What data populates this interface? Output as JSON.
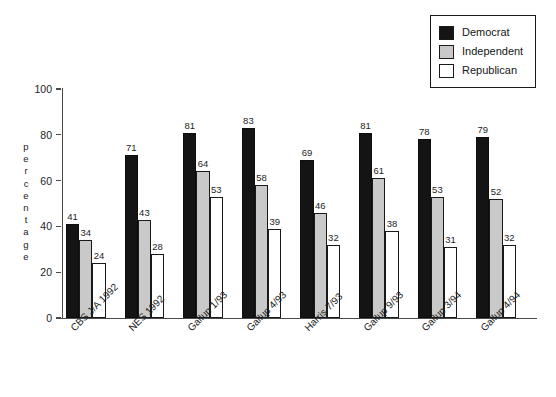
{
  "chart_data": {
    "type": "bar",
    "title": "",
    "subtitle": "",
    "xlabel": "",
    "ylabel": "percentage",
    "ylim": [
      0,
      100
    ],
    "yticks": [
      0,
      20,
      40,
      60,
      80,
      100
    ],
    "grid": false,
    "legend_position": "top-right",
    "categories": [
      "CBS J/A 1992",
      "NES 1992",
      "Gallup 1/93",
      "Gallup 4/93",
      "Harris 7/93",
      "Gallup 9/93",
      "Gallup 3/94",
      "Gallup 4/94"
    ],
    "series": [
      {
        "name": "Democrat",
        "color": "#141414",
        "values": [
          41,
          71,
          81,
          83,
          69,
          81,
          78,
          79
        ]
      },
      {
        "name": "Independent",
        "color": "#c9c9c9",
        "values": [
          34,
          43,
          64,
          58,
          46,
          61,
          53,
          52
        ]
      },
      {
        "name": "Republican",
        "color": "#ffffff",
        "values": [
          24,
          28,
          53,
          39,
          32,
          38,
          31,
          32
        ]
      }
    ]
  },
  "legend": {
    "items": [
      {
        "label": "Democrat",
        "swatch": "legend-swatch-democrat"
      },
      {
        "label": "Independent",
        "swatch": "legend-swatch-independent"
      },
      {
        "label": "Republican",
        "swatch": "legend-swatch-republican"
      }
    ]
  },
  "axis": {
    "y_title": "percentage",
    "y_title_letters": [
      "p",
      "e",
      "r",
      "c",
      "e",
      "n",
      "t",
      "a",
      "g",
      "e"
    ],
    "y_tick_labels": [
      "100",
      "80",
      "60",
      "40",
      "20",
      "0"
    ]
  }
}
